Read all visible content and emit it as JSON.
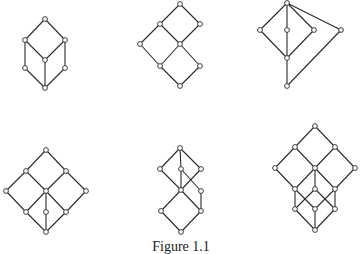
{
  "figure": {
    "caption": "Figure 1.1",
    "stroke_color": "#2a2a2a",
    "node_fill": "#ffffff",
    "node_radius": 2.4,
    "diagrams": [
      {
        "name": "lattice-1",
        "nodes": [
          [
            45,
            19
          ],
          [
            25,
            40
          ],
          [
            65,
            40
          ],
          [
            45,
            60
          ],
          [
            25,
            68
          ],
          [
            65,
            68
          ],
          [
            45,
            88
          ]
        ],
        "edges": [
          [
            0,
            1
          ],
          [
            0,
            2
          ],
          [
            1,
            3
          ],
          [
            2,
            3
          ],
          [
            1,
            4
          ],
          [
            2,
            5
          ],
          [
            3,
            6
          ],
          [
            4,
            6
          ],
          [
            5,
            6
          ]
        ]
      },
      {
        "name": "lattice-2",
        "nodes": [
          [
            180,
            4
          ],
          [
            160,
            24
          ],
          [
            200,
            24
          ],
          [
            140,
            44
          ],
          [
            180,
            44
          ],
          [
            160,
            66
          ],
          [
            200,
            66
          ],
          [
            180,
            86
          ]
        ],
        "edges": [
          [
            0,
            1
          ],
          [
            0,
            2
          ],
          [
            1,
            3
          ],
          [
            1,
            4
          ],
          [
            2,
            4
          ],
          [
            3,
            5
          ],
          [
            4,
            5
          ],
          [
            4,
            6
          ],
          [
            5,
            7
          ],
          [
            6,
            7
          ]
        ]
      },
      {
        "name": "lattice-3",
        "nodes": [
          [
            287,
            3
          ],
          [
            260,
            30
          ],
          [
            287,
            30
          ],
          [
            314,
            30
          ],
          [
            341,
            30
          ],
          [
            287,
            58
          ],
          [
            287,
            86
          ]
        ],
        "edges": [
          [
            0,
            1
          ],
          [
            0,
            2
          ],
          [
            0,
            3
          ],
          [
            0,
            4
          ],
          [
            1,
            5
          ],
          [
            2,
            5
          ],
          [
            3,
            5
          ],
          [
            5,
            6
          ],
          [
            4,
            6
          ]
        ]
      },
      {
        "name": "lattice-4",
        "nodes": [
          [
            46,
            150
          ],
          [
            26,
            171
          ],
          [
            66,
            171
          ],
          [
            6,
            191
          ],
          [
            46,
            191
          ],
          [
            86,
            191
          ],
          [
            26,
            212
          ],
          [
            46,
            212
          ],
          [
            66,
            212
          ],
          [
            46,
            232
          ]
        ],
        "edges": [
          [
            0,
            1
          ],
          [
            0,
            2
          ],
          [
            1,
            3
          ],
          [
            1,
            4
          ],
          [
            2,
            4
          ],
          [
            2,
            5
          ],
          [
            3,
            6
          ],
          [
            4,
            6
          ],
          [
            4,
            7
          ],
          [
            4,
            8
          ],
          [
            5,
            8
          ],
          [
            6,
            9
          ],
          [
            7,
            9
          ],
          [
            8,
            9
          ]
        ]
      },
      {
        "name": "lattice-5",
        "nodes": [
          [
            180,
            148
          ],
          [
            160,
            169
          ],
          [
            181,
            169
          ],
          [
            201,
            169
          ],
          [
            181,
            190
          ],
          [
            201,
            191
          ],
          [
            161,
            211
          ],
          [
            201,
            211
          ],
          [
            181,
            232
          ]
        ],
        "edges": [
          [
            0,
            1
          ],
          [
            0,
            2
          ],
          [
            0,
            3
          ],
          [
            1,
            4
          ],
          [
            2,
            4
          ],
          [
            3,
            4
          ],
          [
            2,
            5
          ],
          [
            5,
            7
          ],
          [
            4,
            6
          ],
          [
            4,
            7
          ],
          [
            6,
            8
          ],
          [
            7,
            8
          ]
        ]
      },
      {
        "name": "lattice-6",
        "nodes": [
          [
            315,
            126
          ],
          [
            295,
            147
          ],
          [
            335,
            147
          ],
          [
            275,
            168
          ],
          [
            315,
            168
          ],
          [
            355,
            168
          ],
          [
            295,
            189
          ],
          [
            315,
            189
          ],
          [
            335,
            189
          ],
          [
            295,
            209
          ],
          [
            315,
            209
          ],
          [
            335,
            209
          ],
          [
            315,
            230
          ]
        ],
        "edges": [
          [
            0,
            1
          ],
          [
            0,
            2
          ],
          [
            1,
            3
          ],
          [
            1,
            4
          ],
          [
            2,
            4
          ],
          [
            2,
            5
          ],
          [
            3,
            6
          ],
          [
            4,
            6
          ],
          [
            4,
            7
          ],
          [
            4,
            8
          ],
          [
            5,
            8
          ],
          [
            6,
            9
          ],
          [
            6,
            10
          ],
          [
            7,
            9
          ],
          [
            7,
            11
          ],
          [
            8,
            10
          ],
          [
            8,
            11
          ],
          [
            9,
            12
          ],
          [
            10,
            12
          ],
          [
            11,
            12
          ]
        ]
      }
    ]
  }
}
